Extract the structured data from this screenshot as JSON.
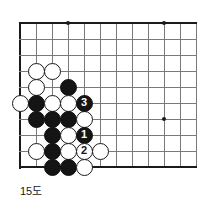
{
  "figure": {
    "caption": "15도",
    "type": "go-board-diagram",
    "board_region": {
      "note": "upper-left corner region of a go board",
      "origin_x": 20,
      "origin_y": 23,
      "spacing": 16,
      "columns": 12,
      "rows": 10
    },
    "colors": {
      "grid": "#7a7a7a",
      "edge": "#1a1a1a",
      "black_stone": "#141414",
      "white_stone": "#ffffff",
      "background": "#ffffff"
    }
  },
  "star_points": [
    {
      "name": "star-point-top-left",
      "col": 3,
      "row": 0
    },
    {
      "name": "star-point-top-right",
      "col": 9,
      "row": 0
    },
    {
      "name": "star-point-center-right",
      "col": 9,
      "row": 6
    }
  ],
  "stones": [
    {
      "name": "white-stone-c3",
      "color": "white",
      "col": 1,
      "row": 3,
      "label": ""
    },
    {
      "name": "white-stone-d3",
      "color": "white",
      "col": 2,
      "row": 3,
      "label": ""
    },
    {
      "name": "white-stone-c4",
      "color": "white",
      "col": 1,
      "row": 4,
      "label": ""
    },
    {
      "name": "black-stone-e4",
      "color": "black",
      "col": 3,
      "row": 4,
      "label": ""
    },
    {
      "name": "white-stone-a5",
      "color": "white",
      "col": 0,
      "row": 5,
      "label": ""
    },
    {
      "name": "black-stone-b5",
      "color": "black",
      "col": 1,
      "row": 5,
      "label": ""
    },
    {
      "name": "white-stone-c5",
      "color": "white",
      "col": 2,
      "row": 5,
      "label": ""
    },
    {
      "name": "white-stone-d5",
      "color": "white",
      "col": 3,
      "row": 5,
      "label": ""
    },
    {
      "name": "black-stone-move-3",
      "color": "black",
      "col": 4,
      "row": 5,
      "label": "3"
    },
    {
      "name": "black-stone-b6",
      "color": "black",
      "col": 1,
      "row": 6,
      "label": ""
    },
    {
      "name": "black-stone-c6",
      "color": "black",
      "col": 2,
      "row": 6,
      "label": ""
    },
    {
      "name": "black-stone-d6",
      "color": "black",
      "col": 3,
      "row": 6,
      "label": ""
    },
    {
      "name": "white-stone-e6",
      "color": "white",
      "col": 4,
      "row": 6,
      "label": ""
    },
    {
      "name": "black-stone-c7",
      "color": "black",
      "col": 2,
      "row": 7,
      "label": ""
    },
    {
      "name": "white-stone-d7",
      "color": "white",
      "col": 3,
      "row": 7,
      "label": ""
    },
    {
      "name": "black-stone-move-1",
      "color": "black",
      "col": 4,
      "row": 7,
      "label": "1"
    },
    {
      "name": "white-stone-b8",
      "color": "white",
      "col": 1,
      "row": 8,
      "label": ""
    },
    {
      "name": "black-stone-c8",
      "color": "black",
      "col": 2,
      "row": 8,
      "label": ""
    },
    {
      "name": "white-stone-d8",
      "color": "white",
      "col": 3,
      "row": 8,
      "label": ""
    },
    {
      "name": "white-stone-move-2",
      "color": "white",
      "col": 4,
      "row": 8,
      "label": "2"
    },
    {
      "name": "white-stone-f8",
      "color": "white",
      "col": 5,
      "row": 8,
      "label": ""
    },
    {
      "name": "black-stone-c9",
      "color": "black",
      "col": 2,
      "row": 9,
      "label": ""
    },
    {
      "name": "black-stone-d9",
      "color": "black",
      "col": 3,
      "row": 9,
      "label": ""
    },
    {
      "name": "white-stone-e9",
      "color": "white",
      "col": 4,
      "row": 9,
      "label": ""
    }
  ]
}
